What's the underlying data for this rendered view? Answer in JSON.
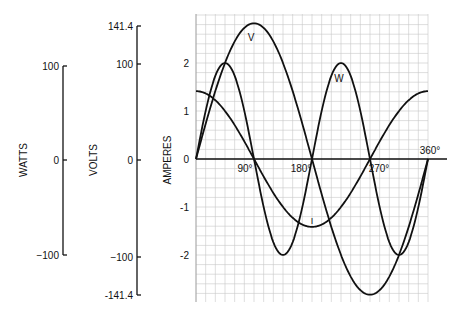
{
  "chart_data": {
    "type": "line",
    "title": "",
    "x": [
      0,
      45,
      90,
      135,
      180,
      225,
      270,
      315,
      360
    ],
    "xlabel": "",
    "x_ticks": [
      "90°",
      "180°",
      "270°",
      "360°"
    ],
    "ylabel": "AMPERES",
    "y_ticks": [
      "2",
      "1",
      "0",
      "-1",
      "-2"
    ],
    "ylim": [
      -2.83,
      2.83
    ],
    "grid": true,
    "series": [
      {
        "name": "V",
        "label": "V",
        "values": [
          0,
          2.0,
          2.83,
          2.0,
          0,
          -2.0,
          -2.83,
          -2.0,
          0
        ],
        "formula": "2.828*sin(theta)"
      },
      {
        "name": "I",
        "label": "I",
        "values": [
          1.414,
          1.0,
          0,
          -1.0,
          -1.414,
          -1.0,
          0,
          1.0,
          1.414
        ],
        "formula": "1.414*cos(theta)"
      },
      {
        "name": "W",
        "label": "W",
        "values": [
          0,
          2.0,
          0,
          -2.0,
          0,
          2.0,
          0,
          -2.0,
          0
        ],
        "formula": "2*sin(2*theta)"
      }
    ],
    "secondary_axes": [
      {
        "label": "WATTS",
        "ticks": [
          "100",
          "0",
          "-100"
        ]
      },
      {
        "label": "VOLTS",
        "ticks": [
          "141.4",
          "100",
          "0",
          "-100",
          "-141.4"
        ]
      }
    ]
  },
  "labels": {
    "watts": "WATTS",
    "volts": "VOLTS",
    "amperes": "AMPERES",
    "w100": "100",
    "w0": "0",
    "wm100": "−100",
    "v1414": "141.4",
    "v100": "100",
    "v0": "0",
    "vm100": "−100",
    "vm1414": "-141.4",
    "a2": "2",
    "a1": "1",
    "a0": "0",
    "am1": "-1",
    "am2": "-2",
    "x90": "90°",
    "x180": "180°",
    "x270": "270°",
    "x360": "360°",
    "curveV": "V",
    "curveW": "W",
    "curveI": "I"
  }
}
